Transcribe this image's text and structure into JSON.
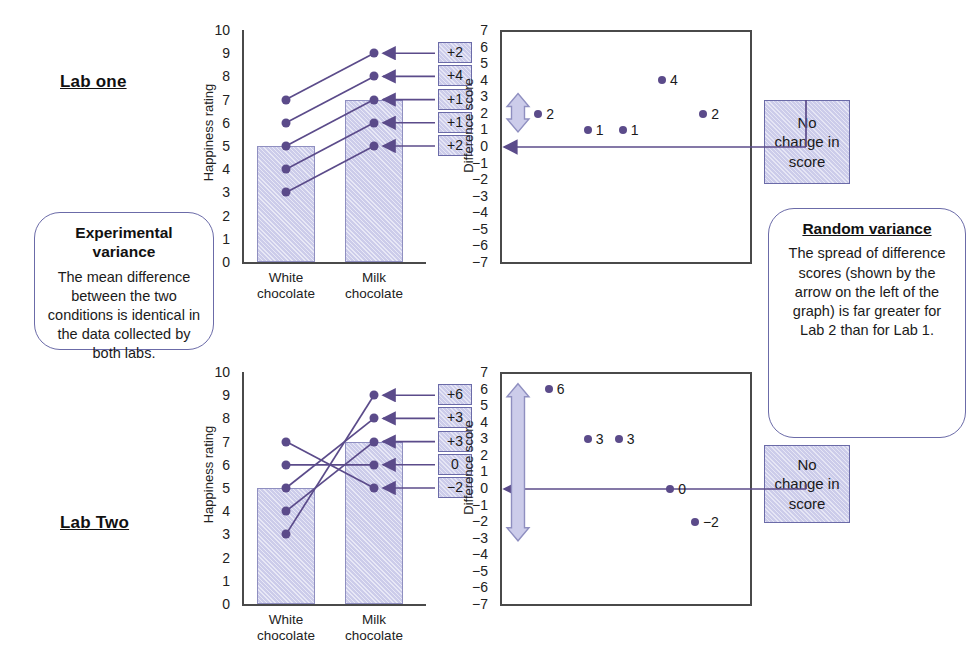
{
  "figure": {
    "accent_purple": "#5b4b8a",
    "fill_lavender": "#ccccea",
    "axis_gray": "#4a4a4a"
  },
  "labels": {
    "lab_one": "Lab one",
    "lab_two": "Lab Two",
    "happiness_axis": "Happiness rating",
    "difference_axis": "Difference score",
    "cat_white_line1": "White",
    "cat_white_line2": "chocolate",
    "cat_milk_line1": "Milk",
    "cat_milk_line2": "chocolate",
    "no_change": "No\nchange\nin score"
  },
  "callouts": {
    "experimental": {
      "title": "Experimental variance",
      "body": "The mean difference between the two conditions is identical in the data collected by both labs."
    },
    "random": {
      "title": "Random variance",
      "body": "The spread of difference scores (shown by the arrow on the left of the graph) is far greater for Lab 2 than for Lab 1."
    },
    "no_change_top": "No change in score",
    "no_change_bottom": "No change in score"
  },
  "chart_data": [
    {
      "type": "bar",
      "id": "lab-one-bars",
      "title": "Lab one",
      "categories": [
        "White chocolate",
        "Milk chocolate"
      ],
      "values": [
        5,
        7
      ],
      "ylabel": "Happiness rating",
      "ylim": [
        0,
        10
      ],
      "yticks": [
        10,
        9,
        8,
        7,
        6,
        5,
        4,
        3,
        2,
        1,
        0
      ],
      "participants": [
        {
          "white": 7,
          "milk": 9,
          "diff": "+2"
        },
        {
          "white": 6,
          "milk": 8,
          "diff": "+4"
        },
        {
          "white": 5,
          "milk": 7,
          "diff": "+1"
        },
        {
          "white": 4,
          "milk": 6,
          "diff": "+1"
        },
        {
          "white": 3,
          "milk": 5,
          "diff": "+2"
        }
      ],
      "diff_badges": [
        "+2",
        "+4",
        "+1",
        "+1",
        "+2"
      ]
    },
    {
      "type": "scatter",
      "id": "lab-one-scatter",
      "ylabel": "Difference score",
      "ylim": [
        -7,
        7
      ],
      "yticks": [
        7,
        6,
        5,
        4,
        3,
        2,
        1,
        0,
        "−1",
        "−2",
        "−3",
        "−4",
        "−5",
        "−6",
        "−7"
      ],
      "points": [
        {
          "x": 0.06,
          "y": 2,
          "label": "2"
        },
        {
          "x": 0.3,
          "y": 1,
          "label": "1"
        },
        {
          "x": 0.47,
          "y": 1,
          "label": "1"
        },
        {
          "x": 0.66,
          "y": 4,
          "label": "4"
        },
        {
          "x": 0.86,
          "y": 2,
          "label": "2"
        }
      ],
      "spread_arrow": {
        "top": 3.2,
        "bottom": 0.9
      },
      "zero_line": 0
    },
    {
      "type": "bar",
      "id": "lab-two-bars",
      "title": "Lab Two",
      "categories": [
        "White chocolate",
        "Milk chocolate"
      ],
      "values": [
        5,
        7
      ],
      "ylabel": "Happiness rating",
      "ylim": [
        0,
        10
      ],
      "yticks": [
        10,
        9,
        8,
        7,
        6,
        5,
        4,
        3,
        2,
        1,
        0
      ],
      "participants": [
        {
          "white": 3,
          "milk": 9,
          "diff": "+6"
        },
        {
          "white": 5,
          "milk": 8,
          "diff": "+3"
        },
        {
          "white": 4,
          "milk": 7,
          "diff": "+3"
        },
        {
          "white": 6,
          "milk": 6,
          "diff": "0"
        },
        {
          "white": 7,
          "milk": 5,
          "diff": "−2"
        }
      ],
      "diff_badges": [
        "+6",
        "+3",
        "+3",
        "0",
        "−2"
      ]
    },
    {
      "type": "scatter",
      "id": "lab-two-scatter",
      "ylabel": "Difference score",
      "ylim": [
        -7,
        7
      ],
      "yticks": [
        7,
        6,
        5,
        4,
        3,
        2,
        1,
        0,
        "−1",
        "−2",
        "−3",
        "−4",
        "−5",
        "−6",
        "−7"
      ],
      "points": [
        {
          "x": 0.11,
          "y": 6,
          "label": "6"
        },
        {
          "x": 0.3,
          "y": 3,
          "label": "3"
        },
        {
          "x": 0.45,
          "y": 3,
          "label": "3"
        },
        {
          "x": 0.7,
          "y": 0,
          "label": "0"
        },
        {
          "x": 0.82,
          "y": -2,
          "label": "−2"
        }
      ],
      "spread_arrow": {
        "top": 6.3,
        "bottom": -3.1
      },
      "zero_line": 0
    }
  ]
}
